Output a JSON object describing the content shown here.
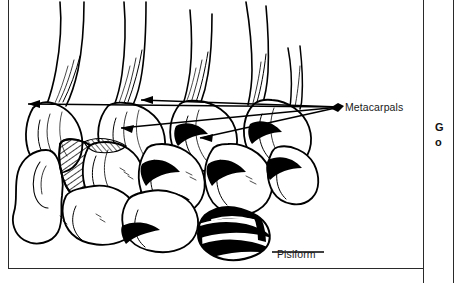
{
  "figure": {
    "style": "black-and-white pen-and-ink anatomical illustration with cross-hatching"
  },
  "callouts": [
    {
      "id": "metacarpals",
      "label": "Metacarpals",
      "leader": "four converging arrows pointing left to the metacarpal shafts",
      "arrow_count": 4
    },
    {
      "id": "pisiform",
      "label": "Pisiform",
      "leader": "single horizontal line pointing left to the pisiform bone",
      "arrow_count": 0
    }
  ],
  "margin_column": {
    "line_1": "G",
    "line_2": "o"
  },
  "colors": {
    "ink": "#000000",
    "rule": "#2a2a2a",
    "text": "#1a1a1a",
    "page": "#ffffff"
  }
}
